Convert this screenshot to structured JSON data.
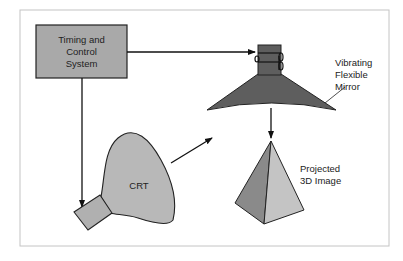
{
  "diagram": {
    "type": "block-diagram",
    "title": "",
    "nodes": {
      "timing": {
        "line1": "Timing and",
        "line2": "Control",
        "line3": "System"
      },
      "crt": {
        "label": "CRT"
      },
      "mirror": {
        "line1": "Vibrating",
        "line2": "Flexible",
        "line3": "Mirror"
      },
      "image": {
        "line1": "Projected",
        "line2": "3D Image"
      }
    },
    "edges": [
      {
        "from": "Timing and Control System",
        "to": "Vibrating Flexible Mirror"
      },
      {
        "from": "Timing and Control System",
        "to": "CRT"
      },
      {
        "from": "CRT",
        "to": "Vibrating Flexible Mirror"
      },
      {
        "from": "Vibrating Flexible Mirror",
        "to": "Projected 3D Image"
      }
    ],
    "colors": {
      "box_fill": "#a9a9a9",
      "crt_fill": "#b8b8b8",
      "mirror_fill": "#5e5e5e",
      "pyramid_dark": "#8a8a8a",
      "pyramid_light": "#c4c4c4",
      "frame": "#bdbdbd"
    }
  }
}
